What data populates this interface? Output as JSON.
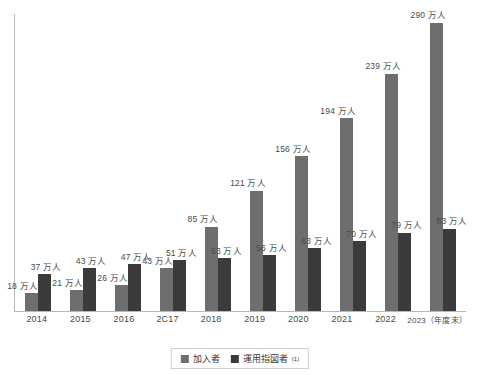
{
  "chart_data": {
    "type": "bar",
    "title": "",
    "subtitle": "",
    "xlabel": "",
    "ylabel": "",
    "unit_suffix": "万人",
    "grid": false,
    "legend_position": "bottom-center",
    "ylim": [
      0,
      300
    ],
    "categories": [
      "2014",
      "2015",
      "2016",
      "2C17",
      "2018",
      "2019",
      "2020",
      "2021",
      "2022",
      "2023（年度末）"
    ],
    "series": [
      {
        "name": "加入者",
        "color": "#6e6e6e",
        "values": [
          18,
          21,
          26,
          43,
          85,
          121,
          156,
          194,
          239,
          290
        ],
        "labels": [
          "18 万人",
          "21 万人",
          "26 万人",
          "43 万人",
          "85 万人",
          "121 万人",
          "156 万人",
          "194 万人",
          "239 万人",
          "290 万人"
        ]
      },
      {
        "name": "運用指図者",
        "color": "#3b3b3b",
        "values": [
          37,
          43,
          47,
          51,
          53,
          56,
          63,
          70,
          79,
          83
        ],
        "labels": [
          "37 万人",
          "43 万人",
          "47 万人",
          "51 万人",
          "53 万人",
          "56 万人",
          "63 万人",
          "70 万人",
          "79 万人",
          "83 万人"
        ]
      }
    ]
  },
  "legend": {
    "items": [
      {
        "label": "加入者",
        "note": ""
      },
      {
        "label": "運用指図者",
        "note": "(1)"
      }
    ]
  }
}
